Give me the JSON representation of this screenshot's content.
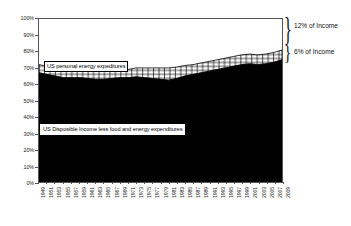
{
  "chart_data": {
    "type": "area",
    "title": "",
    "xlabel": "",
    "ylabel": "",
    "ylim": [
      0,
      100
    ],
    "grid": false,
    "legend_position": "inline-callouts",
    "y_ticks": [
      "0%",
      "10%",
      "20%",
      "30%",
      "40%",
      "50%",
      "60%",
      "70%",
      "80%",
      "90%",
      "100%"
    ],
    "y_tick_values": [
      0,
      10,
      20,
      30,
      40,
      50,
      60,
      70,
      80,
      90,
      100
    ],
    "x": [
      1949,
      1951,
      1953,
      1955,
      1957,
      1959,
      1961,
      1963,
      1965,
      1967,
      1969,
      1971,
      1973,
      1975,
      1977,
      1979,
      1981,
      1983,
      1985,
      1987,
      1989,
      1991,
      1993,
      1995,
      1997,
      1999,
      2001,
      2003,
      2005,
      2007,
      2009
    ],
    "x_tick_labels": [
      "1949",
      "1951",
      "1953",
      "1955",
      "1957",
      "1959",
      "1961",
      "1963",
      "1965",
      "1967",
      "1969",
      "1971",
      "1973",
      "1975",
      "1977",
      "1979",
      "1981",
      "1983",
      "1985",
      "1987",
      "1989",
      "1991",
      "1993",
      "1995",
      "1997",
      "1999",
      "2001",
      "2003",
      "2005",
      "2007",
      "2009"
    ],
    "series": [
      {
        "name": "US Disposible Income less food and energy expenditures",
        "fill": "solid-black",
        "color": "#000000",
        "values": [
          67,
          66,
          65,
          64,
          64,
          64,
          63.5,
          63,
          63,
          63.5,
          64,
          64,
          64.5,
          64,
          63.5,
          63,
          62.5,
          63.5,
          65,
          66,
          67,
          68,
          69,
          70,
          71,
          72,
          72.5,
          72,
          72.5,
          73.5,
          75
        ]
      },
      {
        "name": "US personal energy expeditures",
        "fill": "crosshatch",
        "color": "#ffffff",
        "values": [
          5,
          5,
          5,
          5,
          5,
          5,
          5,
          5,
          5,
          5,
          5,
          5,
          5.5,
          6,
          6.5,
          7,
          7.5,
          7,
          6.5,
          6,
          6,
          6,
          6,
          6,
          6,
          6,
          6,
          6,
          6,
          6,
          6
        ]
      }
    ],
    "band_tops": [
      72,
      71,
      70,
      69,
      69,
      69,
      68.5,
      68,
      68,
      68.5,
      69,
      69,
      70,
      70,
      70,
      70,
      70,
      70.5,
      71.5,
      72,
      73,
      74,
      75,
      76,
      77,
      78,
      78.5,
      78,
      78.5,
      79.5,
      81
    ],
    "annotations": [
      {
        "name": "income-12-percent",
        "text": "12% of Income",
        "target": "top-white-band"
      },
      {
        "name": "income-6-percent",
        "text": "6% of Income",
        "target": "crosshatch-band"
      }
    ],
    "callouts": [
      {
        "name": "energy-expenditures-callout",
        "text": "US personal energy expeditures"
      },
      {
        "name": "disposable-income-callout",
        "text": "US Disposible Income less food and energy expenditures"
      }
    ],
    "colors": {
      "disposable_income_fill": "#000000",
      "energy_band_fill": "#ffffff",
      "energy_band_stroke": "#000000",
      "axis": "#555555",
      "text": "#111111",
      "background": "#ffffff"
    }
  }
}
